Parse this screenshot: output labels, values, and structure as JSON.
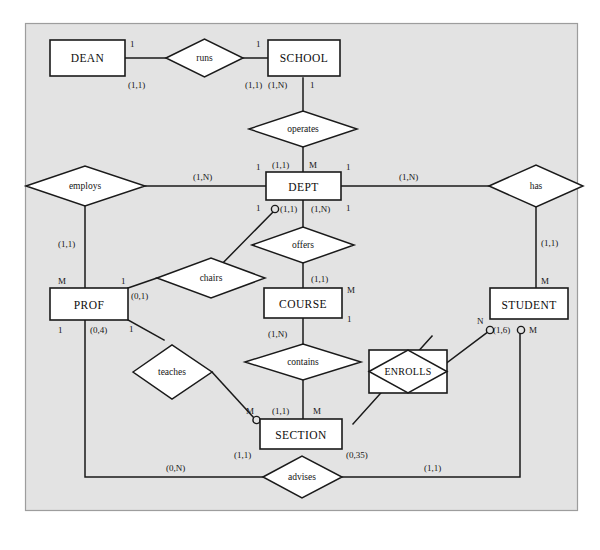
{
  "figure": {
    "kind": "er-diagram",
    "notation": "Chen with min-max (cardinality) and crow-foot optionality circles",
    "panel": {
      "background": "#e2e2e2",
      "border": "#9a9a9a",
      "page_background": "#ffffff"
    },
    "ink": "#1a1a1a",
    "entity_fill": "#ffffff"
  },
  "entities": [
    {
      "id": "dean",
      "label": "DEAN"
    },
    {
      "id": "school",
      "label": "SCHOOL"
    },
    {
      "id": "dept",
      "label": "DEPT"
    },
    {
      "id": "prof",
      "label": "PROF"
    },
    {
      "id": "course",
      "label": "COURSE"
    },
    {
      "id": "student",
      "label": "STUDENT"
    },
    {
      "id": "section",
      "label": "SECTION"
    }
  ],
  "relationships": [
    {
      "id": "runs",
      "label": "runs"
    },
    {
      "id": "operates",
      "label": "operates"
    },
    {
      "id": "employs",
      "label": "employs"
    },
    {
      "id": "has",
      "label": "has"
    },
    {
      "id": "chairs",
      "label": "chairs"
    },
    {
      "id": "offers",
      "label": "offers"
    },
    {
      "id": "teaches",
      "label": "teaches"
    },
    {
      "id": "contains",
      "label": "contains"
    },
    {
      "id": "advises",
      "label": "advises"
    }
  ],
  "associative_entities": [
    {
      "id": "enrolls",
      "label": "ENROLLS"
    }
  ],
  "connectivity_labels": [
    {
      "id": "c-dean-runs",
      "text": "1",
      "near": "DEAN / runs"
    },
    {
      "id": "c-runs-school",
      "text": "1",
      "near": "runs / SCHOOL"
    },
    {
      "id": "c-school-operates",
      "text": "1",
      "near": "SCHOOL / operates"
    },
    {
      "id": "c-dept-operates",
      "text": "M",
      "near": "DEPT / operates"
    },
    {
      "id": "c-dept-employs",
      "text": "1",
      "near": "DEPT / employs"
    },
    {
      "id": "c-dept-has",
      "text": "1",
      "near": "DEPT / has"
    },
    {
      "id": "c-dept-chairs",
      "text": "1",
      "near": "DEPT / chairs"
    },
    {
      "id": "c-dept-offers",
      "text": "1",
      "near": "DEPT / offers"
    },
    {
      "id": "c-prof-employs",
      "text": "M",
      "near": "PROF / employs"
    },
    {
      "id": "c-prof-chairs",
      "text": "1",
      "near": "PROF / chairs"
    },
    {
      "id": "c-prof-advises",
      "text": "1",
      "near": "PROF / advises"
    },
    {
      "id": "c-prof-teaches",
      "text": "1",
      "near": "PROF / teaches"
    },
    {
      "id": "c-course-offers",
      "text": "M",
      "near": "COURSE / offers"
    },
    {
      "id": "c-course-contains",
      "text": "1",
      "near": "COURSE / contains"
    },
    {
      "id": "c-student-has",
      "text": "M",
      "near": "STUDENT / has"
    },
    {
      "id": "c-student-enrolls",
      "text": "N",
      "near": "STUDENT / ENROLLS"
    },
    {
      "id": "c-student-advises",
      "text": "M",
      "near": "STUDENT / advises"
    },
    {
      "id": "c-section-teaches",
      "text": "M",
      "near": "SECTION / teaches"
    },
    {
      "id": "c-section-contains",
      "text": "M",
      "near": "SECTION / contains"
    }
  ],
  "cardinality_labels": [
    {
      "id": "k-dean-runs",
      "text": "(1,1)"
    },
    {
      "id": "k-school-runs",
      "text": "(1,1)"
    },
    {
      "id": "k-school-operates",
      "text": "(1,N)"
    },
    {
      "id": "k-dept-operates",
      "text": "(1,1)"
    },
    {
      "id": "k-dept-employs",
      "text": "(1,N)"
    },
    {
      "id": "k-dept-has",
      "text": "(1,N)"
    },
    {
      "id": "k-dept-chairs",
      "text": "(1,1)"
    },
    {
      "id": "k-dept-offers",
      "text": "(1,N)"
    },
    {
      "id": "k-prof-employs",
      "text": "(1,1)"
    },
    {
      "id": "k-prof-chairs",
      "text": "(0,1)"
    },
    {
      "id": "k-prof-teaches",
      "text": "(0,4)"
    },
    {
      "id": "k-prof-advises",
      "text": "(0,N)"
    },
    {
      "id": "k-course-offers",
      "text": "(1,1)"
    },
    {
      "id": "k-course-contains",
      "text": "(1,N)"
    },
    {
      "id": "k-student-has",
      "text": "(1,1)"
    },
    {
      "id": "k-student-enrolls",
      "text": "(1,6)"
    },
    {
      "id": "k-student-advises",
      "text": "(1,1)"
    },
    {
      "id": "k-section-contains",
      "text": "(1,1)"
    },
    {
      "id": "k-section-teaches",
      "text": "(1,1)"
    },
    {
      "id": "k-section-enrolls",
      "text": "(0,35)"
    }
  ]
}
